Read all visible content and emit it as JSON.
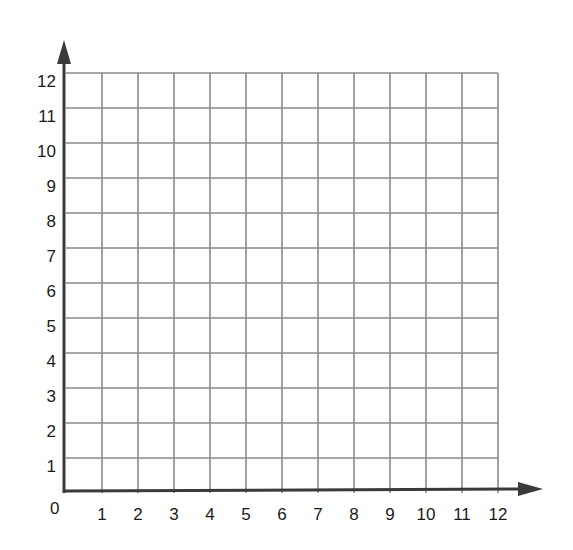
{
  "chart_data": {
    "type": "scatter",
    "title": "",
    "xlabel": "",
    "ylabel": "",
    "xlim": [
      0,
      12
    ],
    "ylim": [
      0,
      12
    ],
    "grid": true,
    "origin_label": "0",
    "x_ticks": [
      "1",
      "2",
      "3",
      "4",
      "5",
      "6",
      "7",
      "8",
      "9",
      "10",
      "11",
      "12"
    ],
    "y_ticks": [
      "1",
      "2",
      "3",
      "4",
      "5",
      "6",
      "7",
      "8",
      "9",
      "10",
      "11",
      "12"
    ],
    "series": [],
    "colors": {
      "grid": "#8a8a8a",
      "axis": "#3a3a3a",
      "text": "#1a1a1a"
    }
  }
}
